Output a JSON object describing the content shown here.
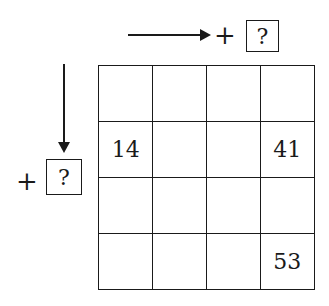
{
  "diagram": {
    "type": "number-grid-puzzle",
    "rows": 4,
    "cols": 4,
    "horizontal_operator": {
      "direction": "right",
      "sign": "+",
      "value": "?"
    },
    "vertical_operator": {
      "direction": "down",
      "sign": "+",
      "value": "?"
    },
    "cells": [
      [
        "",
        "",
        "",
        ""
      ],
      [
        "14",
        "",
        "",
        "41"
      ],
      [
        "",
        "",
        "",
        ""
      ],
      [
        "",
        "",
        "",
        "53"
      ]
    ],
    "colors": {
      "line": "#1a1a1a",
      "background": "#ffffff"
    }
  }
}
